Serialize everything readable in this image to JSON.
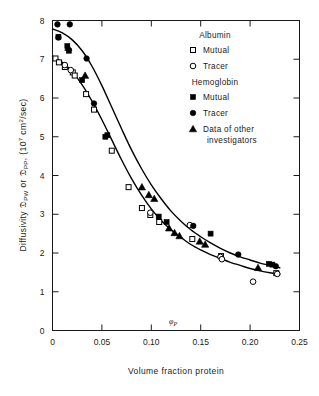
{
  "figure": {
    "background_color": "#ffffff",
    "ink_color": "#1a1a1a"
  },
  "chart_data": {
    "type": "scatter",
    "title": "",
    "xlabel": "Volume fraction protein",
    "ylabel": "Diffusivity 𝔇PW or 𝔇PP, (107 cm2/sec)",
    "ylabel_parts": {
      "prefix": "Diffusivity ",
      "symbol1": "𝔇",
      "sub1": "PW",
      "conjunction": " or ",
      "symbol2": "𝔇",
      "sub2": "PP",
      "suffix": ", (10",
      "exponent": "7",
      "units": " cm",
      "units_exp": "2",
      "units_tail": "/sec)"
    },
    "xlim": [
      0,
      0.25
    ],
    "ylim": [
      0,
      8
    ],
    "xticks": [
      0,
      0.05,
      0.1,
      0.15,
      0.2,
      0.25
    ],
    "xtick_labels": [
      "0",
      "0.05",
      "0.10",
      "0.15",
      "0.20",
      "0.25"
    ],
    "yticks": [
      0,
      1,
      2,
      3,
      4,
      5,
      6,
      7,
      8
    ],
    "ytick_labels": [
      "0",
      "1",
      "2",
      "3",
      "4",
      "5",
      "6",
      "7",
      "8"
    ],
    "grid": false,
    "legend_position": "upper-right-inside",
    "annotations": [
      {
        "text": "φ",
        "sub": "P",
        "x": 0.122,
        "y": 0.16,
        "name": "phi-p-annotation"
      }
    ],
    "series": [
      {
        "name": "Albumin Mutual",
        "marker": "open-square",
        "group": "Albumin",
        "points": [
          [
            0.003,
            7.02
          ],
          [
            0.0065,
            6.92
          ],
          [
            0.0125,
            6.8
          ],
          [
            0.0205,
            6.66
          ],
          [
            0.0225,
            6.58
          ],
          [
            0.034,
            6.1
          ],
          [
            0.042,
            5.7
          ],
          [
            0.06,
            4.64
          ],
          [
            0.077,
            3.7
          ],
          [
            0.0905,
            3.16
          ],
          [
            0.099,
            2.98
          ],
          [
            0.108,
            2.8
          ],
          [
            0.1415,
            2.36
          ],
          [
            0.1705,
            1.92
          ],
          [
            0.2265,
            1.48
          ]
        ]
      },
      {
        "name": "Albumin Tracer",
        "marker": "open-circle",
        "group": "Albumin",
        "points": [
          [
            0.0125,
            6.85
          ],
          [
            0.0185,
            6.72
          ],
          [
            0.099,
            3.04
          ],
          [
            0.139,
            2.72
          ],
          [
            0.17,
            1.9
          ],
          [
            0.1715,
            1.84
          ],
          [
            0.203,
            1.26
          ],
          [
            0.2275,
            1.46
          ]
        ]
      },
      {
        "name": "Hemoglobin Mutual",
        "marker": "filled-square",
        "group": "Hemoglobin",
        "points": [
          [
            0.006,
            7.58
          ],
          [
            0.015,
            7.34
          ],
          [
            0.0165,
            7.22
          ],
          [
            0.03,
            6.46
          ],
          [
            0.0535,
            5.0
          ],
          [
            0.0555,
            5.04
          ],
          [
            0.1075,
            2.94
          ],
          [
            0.1155,
            2.8
          ],
          [
            0.16,
            2.5
          ],
          [
            0.219,
            1.72
          ],
          [
            0.2225,
            1.7
          ]
        ]
      },
      {
        "name": "Hemoglobin Tracer",
        "marker": "filled-circle",
        "group": "Hemoglobin",
        "points": [
          [
            0.005,
            7.9
          ],
          [
            0.0175,
            7.9
          ],
          [
            0.006,
            7.56
          ],
          [
            0.0345,
            7.02
          ],
          [
            0.042,
            5.86
          ],
          [
            0.1425,
            2.7
          ],
          [
            0.188,
            1.96
          ],
          [
            0.226,
            1.66
          ]
        ]
      },
      {
        "name": "Data of other investigators",
        "marker": "filled-triangle",
        "group": "Other",
        "points": [
          [
            0.016,
            7.3
          ],
          [
            0.033,
            6.58
          ],
          [
            0.0905,
            3.7
          ],
          [
            0.0975,
            3.5
          ],
          [
            0.103,
            3.4
          ],
          [
            0.118,
            2.64
          ],
          [
            0.1235,
            2.52
          ],
          [
            0.1285,
            2.44
          ],
          [
            0.149,
            2.3
          ],
          [
            0.1545,
            2.22
          ],
          [
            0.208,
            1.62
          ]
        ]
      }
    ],
    "curves": [
      {
        "name": "hemoglobin-curve",
        "path": [
          [
            0.0,
            7.78
          ],
          [
            0.01,
            7.68
          ],
          [
            0.02,
            7.5
          ],
          [
            0.03,
            7.22
          ],
          [
            0.04,
            6.82
          ],
          [
            0.05,
            6.32
          ],
          [
            0.06,
            5.76
          ],
          [
            0.07,
            5.2
          ],
          [
            0.08,
            4.66
          ],
          [
            0.09,
            4.18
          ],
          [
            0.1,
            3.76
          ],
          [
            0.11,
            3.4
          ],
          [
            0.12,
            3.08
          ],
          [
            0.13,
            2.82
          ],
          [
            0.14,
            2.6
          ],
          [
            0.15,
            2.42
          ],
          [
            0.16,
            2.26
          ],
          [
            0.17,
            2.12
          ],
          [
            0.18,
            2.0
          ],
          [
            0.19,
            1.9
          ],
          [
            0.2,
            1.82
          ],
          [
            0.21,
            1.74
          ],
          [
            0.22,
            1.68
          ],
          [
            0.23,
            1.62
          ]
        ]
      },
      {
        "name": "albumin-curve",
        "path": [
          [
            0.0,
            7.08
          ],
          [
            0.01,
            6.92
          ],
          [
            0.02,
            6.68
          ],
          [
            0.03,
            6.34
          ],
          [
            0.04,
            5.92
          ],
          [
            0.05,
            5.44
          ],
          [
            0.06,
            4.92
          ],
          [
            0.07,
            4.4
          ],
          [
            0.08,
            3.92
          ],
          [
            0.09,
            3.5
          ],
          [
            0.1,
            3.14
          ],
          [
            0.11,
            2.84
          ],
          [
            0.12,
            2.6
          ],
          [
            0.13,
            2.4
          ],
          [
            0.14,
            2.22
          ],
          [
            0.15,
            2.08
          ],
          [
            0.16,
            1.96
          ],
          [
            0.17,
            1.86
          ],
          [
            0.18,
            1.76
          ],
          [
            0.19,
            1.68
          ],
          [
            0.2,
            1.6
          ],
          [
            0.21,
            1.54
          ],
          [
            0.22,
            1.49
          ],
          [
            0.23,
            1.45
          ]
        ]
      }
    ],
    "legend": {
      "groups": [
        {
          "heading": "Albumin",
          "entries": [
            {
              "label": "Mutual",
              "marker": "open-square"
            },
            {
              "label": "Tracer",
              "marker": "open-circle"
            }
          ]
        },
        {
          "heading": "Hemoglobin",
          "entries": [
            {
              "label": "Mutual",
              "marker": "filled-square"
            },
            {
              "label": "Tracer",
              "marker": "filled-circle"
            },
            {
              "label": "Data of other",
              "label2": "investigators",
              "marker": "filled-triangle"
            }
          ]
        }
      ]
    }
  }
}
